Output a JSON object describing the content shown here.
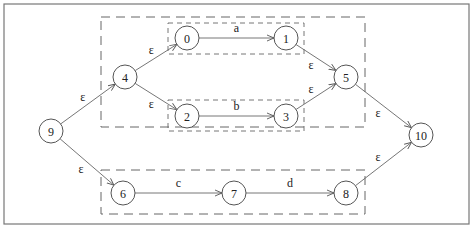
{
  "diagram": {
    "type": "nfa-thompson-construction",
    "nodes": [
      {
        "id": "9",
        "label": "9",
        "x": 51,
        "y": 131
      },
      {
        "id": "4",
        "label": "4",
        "x": 125,
        "y": 77
      },
      {
        "id": "0",
        "label": "0",
        "x": 187,
        "y": 38
      },
      {
        "id": "1",
        "label": "1",
        "x": 286,
        "y": 38
      },
      {
        "id": "2",
        "label": "2",
        "x": 187,
        "y": 116
      },
      {
        "id": "3",
        "label": "3",
        "x": 286,
        "y": 116
      },
      {
        "id": "5",
        "label": "5",
        "x": 346,
        "y": 77
      },
      {
        "id": "6",
        "label": "6",
        "x": 123,
        "y": 193
      },
      {
        "id": "7",
        "label": "7",
        "x": 234,
        "y": 193
      },
      {
        "id": "8",
        "label": "8",
        "x": 346,
        "y": 193
      },
      {
        "id": "10",
        "label": "10",
        "x": 421,
        "y": 135
      }
    ],
    "edges": [
      {
        "from": "9",
        "to": "4",
        "label": "ε"
      },
      {
        "from": "9",
        "to": "6",
        "label": "ε"
      },
      {
        "from": "4",
        "to": "0",
        "label": "ε"
      },
      {
        "from": "4",
        "to": "2",
        "label": "ε"
      },
      {
        "from": "0",
        "to": "1",
        "label": "a"
      },
      {
        "from": "2",
        "to": "3",
        "label": "b"
      },
      {
        "from": "1",
        "to": "5",
        "label": "ε"
      },
      {
        "from": "3",
        "to": "5",
        "label": "ε"
      },
      {
        "from": "5",
        "to": "10",
        "label": "ε"
      },
      {
        "from": "6",
        "to": "7",
        "label": "c"
      },
      {
        "from": "7",
        "to": "8",
        "label": "d"
      },
      {
        "from": "8",
        "to": "10",
        "label": "ε"
      }
    ],
    "groups": [
      {
        "name": "union-a-b",
        "members": [
          "4",
          "0",
          "1",
          "2",
          "3",
          "5"
        ]
      },
      {
        "name": "sub-a",
        "members": [
          "0",
          "1"
        ]
      },
      {
        "name": "sub-b",
        "members": [
          "2",
          "3"
        ]
      },
      {
        "name": "concat-c-d",
        "members": [
          "6",
          "7",
          "8"
        ]
      }
    ]
  }
}
